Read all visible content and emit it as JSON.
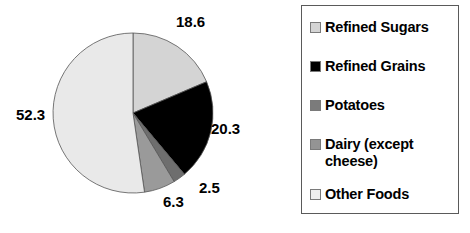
{
  "chart_data": {
    "type": "pie",
    "title": "",
    "subtitle": "",
    "xlabel": "",
    "ylabel": "",
    "grid": false,
    "legend_position": "right",
    "start_angle_deg": 0,
    "direction": "clockwise",
    "categories": [
      "Refined Sugars",
      "Refined Grains",
      "Dairy (except cheese)",
      "Potatoes",
      "Other Foods"
    ],
    "values": [
      18.6,
      20.3,
      2.5,
      6.3,
      52.3
    ],
    "value_labels": [
      "18.6",
      "20.3",
      "2.5",
      "6.3",
      "52.3"
    ],
    "colors": [
      "#d4d4d4",
      "#000000",
      "#6e6e6e",
      "#9a9a9a",
      "#e9e9e9"
    ],
    "slices": [
      {
        "label": "Refined Sugars",
        "value": 18.6,
        "value_label": "18.6",
        "color": "#d4d4d4"
      },
      {
        "label": "Refined Grains",
        "value": 20.3,
        "value_label": "20.3",
        "color": "#000000"
      },
      {
        "label": "Dairy (except cheese)",
        "value": 2.5,
        "value_label": "2.5",
        "color": "#6e6e6e"
      },
      {
        "label": "Potatoes",
        "value": 6.3,
        "value_label": "6.3",
        "color": "#9a9a9a"
      },
      {
        "label": "Other Foods",
        "value": 52.3,
        "value_label": "52.3",
        "color": "#e9e9e9"
      }
    ]
  },
  "legend": {
    "items": [
      {
        "label": "Refined Sugars",
        "color": "#d4d4d4",
        "swatch_name": "legend-swatch-refined-sugars"
      },
      {
        "label": "Refined Grains",
        "color": "#000000",
        "swatch_name": "legend-swatch-refined-grains"
      },
      {
        "label": "Potatoes",
        "color": "#7b7b7b",
        "swatch_name": "legend-swatch-potatoes"
      },
      {
        "label": "Dairy (except\ncheese)",
        "color": "#949494",
        "swatch_name": "legend-swatch-dairy"
      },
      {
        "label": "Other Foods",
        "color": "#eeeeee",
        "swatch_name": "legend-swatch-other-foods"
      }
    ]
  },
  "pie_labels": {
    "refined_sugars": "18.6",
    "refined_grains": "20.3",
    "dairy": "2.5",
    "potatoes": "6.3",
    "other_foods": "52.3"
  }
}
